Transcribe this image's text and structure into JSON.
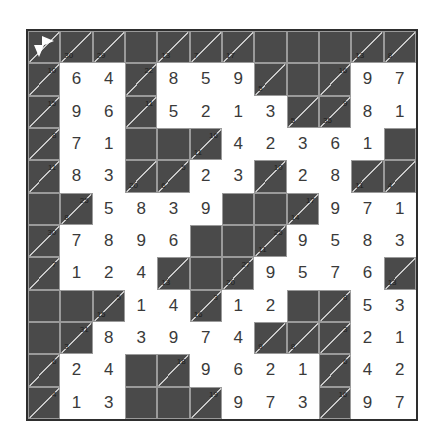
{
  "puzzle": {
    "type": "kakuro",
    "rows": 12,
    "cols": 12,
    "grid": [
      [
        {
          "t": "start"
        },
        {
          "t": "clue",
          "d": "30"
        },
        {
          "t": "clue",
          "d": "29"
        },
        {
          "t": "black"
        },
        {
          "t": "clue",
          "d": "13"
        },
        {
          "t": "clue",
          "d": "7"
        },
        {
          "t": "clue",
          "d": "17"
        },
        {
          "t": "black"
        },
        {
          "t": "black"
        },
        {
          "t": "black"
        },
        {
          "t": "clue",
          "d": "13"
        },
        {
          "t": "clue",
          "d": "8"
        }
      ],
      [
        {
          "t": "clue",
          "r": "10"
        },
        {
          "t": "white",
          "v": "6"
        },
        {
          "t": "white",
          "v": "4"
        },
        {
          "t": "clue",
          "r": "22"
        },
        {
          "t": "white",
          "v": "8"
        },
        {
          "t": "white",
          "v": "5"
        },
        {
          "t": "white",
          "v": "9"
        },
        {
          "t": "clue",
          "d": "5"
        },
        {
          "t": "black"
        },
        {
          "t": "clue",
          "r": "16"
        },
        {
          "t": "white",
          "v": "9"
        },
        {
          "t": "white",
          "v": "7"
        }
      ],
      [
        {
          "t": "clue",
          "r": "15"
        },
        {
          "t": "white",
          "v": "9"
        },
        {
          "t": "white",
          "v": "6"
        },
        {
          "t": "clue",
          "r": "11"
        },
        {
          "t": "white",
          "v": "5"
        },
        {
          "t": "white",
          "v": "2"
        },
        {
          "t": "white",
          "v": "1"
        },
        {
          "t": "white",
          "v": "3"
        },
        {
          "t": "clue",
          "d": "5"
        },
        {
          "t": "clue",
          "d": "35",
          "r": "9"
        },
        {
          "t": "white",
          "v": "8"
        },
        {
          "t": "white",
          "v": "1"
        }
      ],
      [
        {
          "t": "clue",
          "r": "8"
        },
        {
          "t": "white",
          "v": "7"
        },
        {
          "t": "white",
          "v": "1"
        },
        {
          "t": "black"
        },
        {
          "t": "black"
        },
        {
          "t": "clue",
          "d": "11",
          "r": "16"
        },
        {
          "t": "white",
          "v": "4"
        },
        {
          "t": "white",
          "v": "2"
        },
        {
          "t": "white",
          "v": "3"
        },
        {
          "t": "white",
          "v": "6"
        },
        {
          "t": "white",
          "v": "1"
        },
        {
          "t": "black"
        }
      ],
      [
        {
          "t": "clue",
          "r": "11"
        },
        {
          "t": "white",
          "v": "8"
        },
        {
          "t": "white",
          "v": "3"
        },
        {
          "t": "clue",
          "d": "20"
        },
        {
          "t": "clue",
          "d": "6",
          "r": "5"
        },
        {
          "t": "white",
          "v": "2"
        },
        {
          "t": "white",
          "v": "3"
        },
        {
          "t": "clue",
          "r": "10"
        },
        {
          "t": "white",
          "v": "2"
        },
        {
          "t": "white",
          "v": "8"
        },
        {
          "t": "clue",
          "d": "11"
        },
        {
          "t": "clue",
          "d": "4"
        }
      ],
      [
        {
          "t": "black"
        },
        {
          "t": "clue",
          "d": "8",
          "r": "25"
        },
        {
          "t": "white",
          "v": "5"
        },
        {
          "t": "white",
          "v": "8"
        },
        {
          "t": "white",
          "v": "3"
        },
        {
          "t": "white",
          "v": "9"
        },
        {
          "t": "black"
        },
        {
          "t": "black"
        },
        {
          "t": "clue",
          "d": "14",
          "r": "17"
        },
        {
          "t": "white",
          "v": "9"
        },
        {
          "t": "white",
          "v": "7"
        },
        {
          "t": "white",
          "v": "1"
        }
      ],
      [
        {
          "t": "clue",
          "r": "30"
        },
        {
          "t": "white",
          "v": "7"
        },
        {
          "t": "white",
          "v": "8"
        },
        {
          "t": "white",
          "v": "9"
        },
        {
          "t": "white",
          "v": "6"
        },
        {
          "t": "black"
        },
        {
          "t": "black"
        },
        {
          "t": "clue",
          "d": "11",
          "r": "25"
        },
        {
          "t": "white",
          "v": "9"
        },
        {
          "t": "white",
          "v": "5"
        },
        {
          "t": "white",
          "v": "8"
        },
        {
          "t": "white",
          "v": "3"
        }
      ],
      [
        {
          "t": "clue",
          "r": "7"
        },
        {
          "t": "white",
          "v": "1"
        },
        {
          "t": "white",
          "v": "2"
        },
        {
          "t": "white",
          "v": "4"
        },
        {
          "t": "clue",
          "d": "13"
        },
        {
          "t": "black"
        },
        {
          "t": "clue",
          "d": "20",
          "r": "27"
        },
        {
          "t": "white",
          "v": "9"
        },
        {
          "t": "white",
          "v": "5"
        },
        {
          "t": "white",
          "v": "7"
        },
        {
          "t": "white",
          "v": "6"
        },
        {
          "t": "clue",
          "d": "13"
        }
      ],
      [
        {
          "t": "black"
        },
        {
          "t": "black"
        },
        {
          "t": "clue",
          "d": "15",
          "r": "5"
        },
        {
          "t": "white",
          "v": "1"
        },
        {
          "t": "white",
          "v": "4"
        },
        {
          "t": "clue",
          "d": "16",
          "r": "3"
        },
        {
          "t": "white",
          "v": "1"
        },
        {
          "t": "white",
          "v": "2"
        },
        {
          "t": "black"
        },
        {
          "t": "clue",
          "r": "8"
        },
        {
          "t": "white",
          "v": "5"
        },
        {
          "t": "white",
          "v": "3"
        }
      ],
      [
        {
          "t": "black"
        },
        {
          "t": "clue",
          "d": "3",
          "r": "31"
        },
        {
          "t": "white",
          "v": "8"
        },
        {
          "t": "white",
          "v": "3"
        },
        {
          "t": "white",
          "v": "9"
        },
        {
          "t": "white",
          "v": "7"
        },
        {
          "t": "white",
          "v": "4"
        },
        {
          "t": "clue",
          "d": "9"
        },
        {
          "t": "clue",
          "d": "8"
        },
        {
          "t": "clue",
          "r": "3"
        },
        {
          "t": "white",
          "v": "2"
        },
        {
          "t": "white",
          "v": "1"
        }
      ],
      [
        {
          "t": "clue",
          "r": "6"
        },
        {
          "t": "white",
          "v": "2"
        },
        {
          "t": "white",
          "v": "4"
        },
        {
          "t": "black"
        },
        {
          "t": "clue",
          "r": "18"
        },
        {
          "t": "white",
          "v": "9"
        },
        {
          "t": "white",
          "v": "6"
        },
        {
          "t": "white",
          "v": "2"
        },
        {
          "t": "white",
          "v": "1"
        },
        {
          "t": "clue",
          "r": "6"
        },
        {
          "t": "white",
          "v": "4"
        },
        {
          "t": "white",
          "v": "2"
        }
      ],
      [
        {
          "t": "clue",
          "r": "4"
        },
        {
          "t": "white",
          "v": "1"
        },
        {
          "t": "white",
          "v": "3"
        },
        {
          "t": "black"
        },
        {
          "t": "black"
        },
        {
          "t": "clue",
          "r": "19"
        },
        {
          "t": "white",
          "v": "9"
        },
        {
          "t": "white",
          "v": "7"
        },
        {
          "t": "white",
          "v": "3"
        },
        {
          "t": "clue",
          "r": "16"
        },
        {
          "t": "white",
          "v": "9"
        },
        {
          "t": "white",
          "v": "7"
        }
      ]
    ]
  },
  "colors": {
    "block": "#4a4a4a",
    "cell": "#ffffff",
    "digit": "#3a3a3a",
    "grid_line": "#9a9a9a"
  }
}
